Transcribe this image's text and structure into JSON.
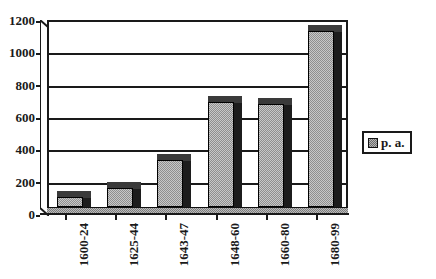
{
  "chart_data": {
    "type": "bar",
    "title": "",
    "subtitle": "",
    "xlabel": "",
    "ylabel": "",
    "categories": [
      "1600-24",
      "1625-44",
      "1643-47",
      "1648-60",
      "1660-80",
      "1680-99"
    ],
    "series": [
      {
        "name": "p. a.",
        "values": [
          60,
          120,
          290,
          650,
          640,
          1090
        ]
      }
    ],
    "ylim": [
      0,
      1200
    ],
    "ytick_values": [
      0,
      200,
      400,
      600,
      800,
      1000,
      1200
    ],
    "ytick_labels": [
      "0",
      "200",
      "400",
      "600",
      "800",
      "1000",
      "1200"
    ],
    "grid": true,
    "grid_axis": "y",
    "legend": {
      "position": "right",
      "entries": [
        {
          "label": "p. a.",
          "swatch_icon": "gray-square-swatch",
          "color": "#8a8a8a"
        }
      ]
    },
    "style": {
      "three_d": true,
      "bar_fill": "#9a9a9a",
      "bar_edge": "#000000",
      "bar_shadow": "#1c1c1c",
      "axis_color": "#1a1a1a",
      "background": "#ffffff",
      "xlabel_rotation": -90
    }
  }
}
